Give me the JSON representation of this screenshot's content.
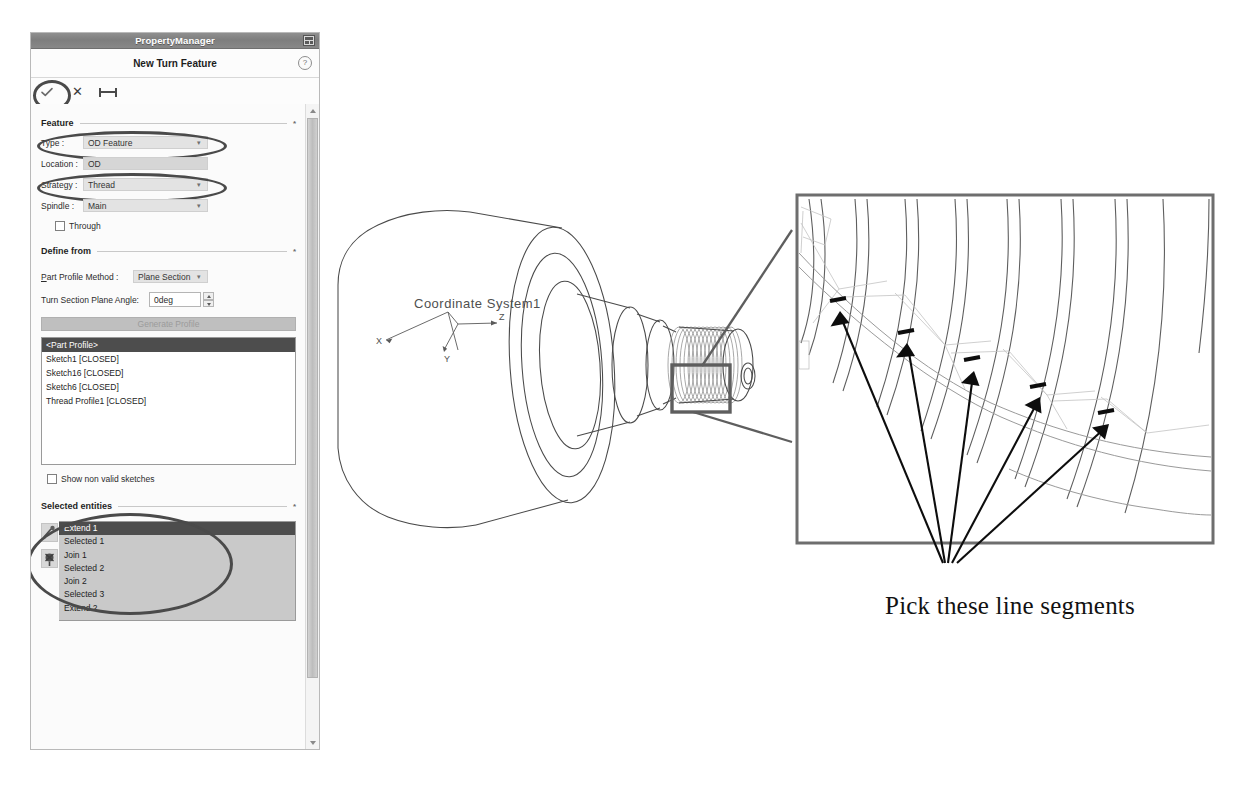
{
  "panel": {
    "titlebar": {
      "title": "PropertyManager",
      "icon": "window-grid-icon"
    },
    "header": {
      "title": "New Turn Feature",
      "help_icon": "help-icon"
    },
    "toolbar": {
      "ok_icon": "checkmark-icon",
      "cancel_icon": "close-x-icon",
      "pin_icon": "pin-icon"
    },
    "sections": {
      "feature": {
        "title": "Feature",
        "collapse": "*",
        "rows": [
          {
            "label": "Type :",
            "value": "OD Feature",
            "kind": "combo"
          },
          {
            "label": "Location :",
            "value": "OD",
            "kind": "flat"
          },
          {
            "label": "Strategy :",
            "value": "Thread",
            "kind": "combo"
          },
          {
            "label": "Spindle :",
            "value": "Main",
            "kind": "combo"
          }
        ],
        "checkbox": {
          "label": "Through",
          "checked": false
        }
      },
      "define_from": {
        "title": "Define from",
        "collapse": "*",
        "profile_method": {
          "label": "Part Profile Method :",
          "value": "Plane Section"
        },
        "plane_angle": {
          "label": "Turn Section Plane Angle:",
          "value": "0deg"
        },
        "generate_button": {
          "label": "Generate Profile",
          "enabled": false
        },
        "list": [
          {
            "label": "<Part Profile>",
            "selected": true
          },
          {
            "label": "Sketch1 [CLOSED]",
            "selected": false
          },
          {
            "label": "Sketch16 [CLOSED]",
            "selected": false
          },
          {
            "label": "Sketch6 [CLOSED]",
            "selected": false
          },
          {
            "label": "Thread Profile1 [CLOSED]",
            "selected": false
          }
        ],
        "checkbox": {
          "label": "Show non valid sketches",
          "checked": false
        }
      },
      "selected_entities": {
        "title": "Selected entities",
        "collapse": "*",
        "tools": [
          "extend-tool-icon",
          "delete-tool-icon"
        ],
        "list": [
          {
            "label": "Extend 1",
            "selected": true
          },
          {
            "label": "Selected 1",
            "selected": false
          },
          {
            "label": "Join 1",
            "selected": false
          },
          {
            "label": "Selected 2",
            "selected": false
          },
          {
            "label": "Join 2",
            "selected": false
          },
          {
            "label": "Selected 3",
            "selected": false
          },
          {
            "label": "Extend 2",
            "selected": false
          }
        ]
      }
    }
  },
  "viewport": {
    "coordinate_system_label": "Coordinate System1",
    "axes": {
      "x": "X",
      "y": "Y",
      "z": "Z"
    }
  },
  "annotation": {
    "caption": "Pick these line segments",
    "arrow_count": 5,
    "highlight_color": "#4a4a4a"
  }
}
